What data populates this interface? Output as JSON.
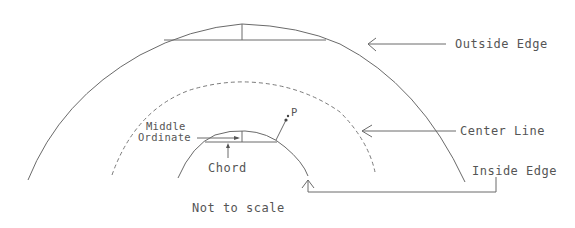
{
  "diagram": {
    "labels": {
      "outside_edge": "Outside Edge",
      "center_line": "Center Line",
      "inside_edge": "Inside Edge",
      "middle_ordinate_line1": "Middle",
      "middle_ordinate_line2": "Ordinate",
      "chord": "Chord",
      "point": "P",
      "scale_note": "Not to scale"
    },
    "colors": {
      "line": "#6a6a6a",
      "text": "#555555",
      "background": "#ffffff"
    }
  }
}
